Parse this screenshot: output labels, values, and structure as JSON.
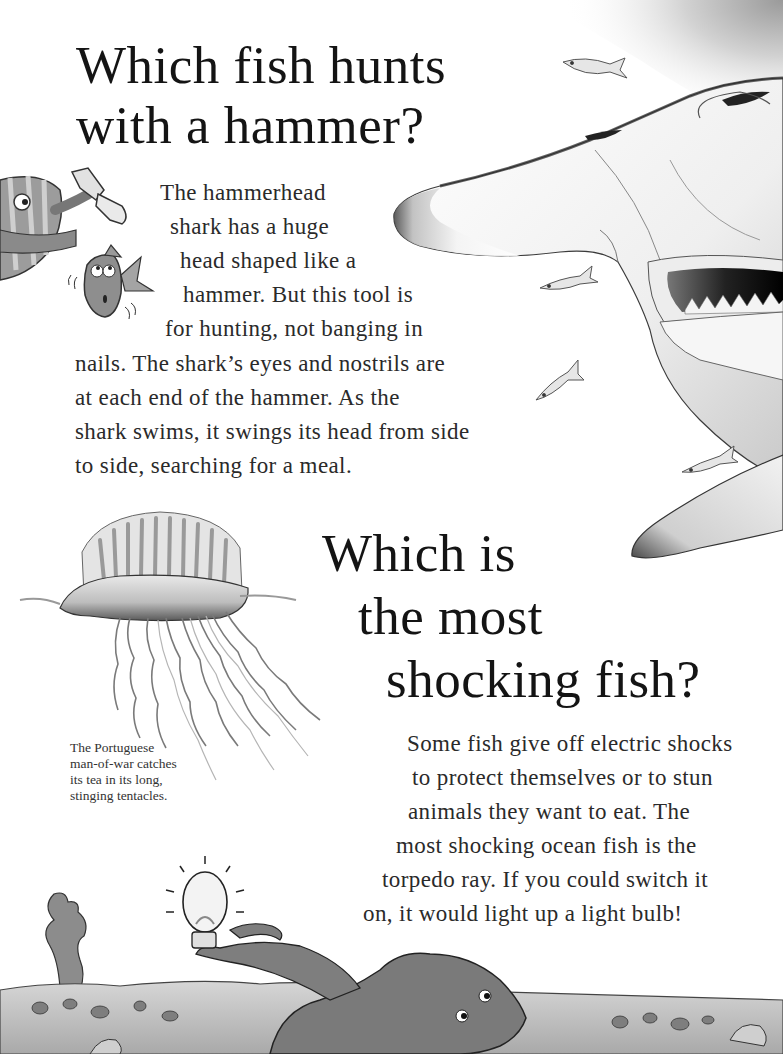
{
  "section_hammerhead": {
    "heading_lines": [
      "Which fish hunts",
      "with a hammer?"
    ],
    "body_lines": [
      "The hammerhead",
      "shark has a huge",
      "head shaped like a",
      "hammer. But this tool is",
      "for hunting, not banging in",
      "nails. The shark’s eyes and nostrils are",
      "at each end of the hammer.  As the",
      "shark swims, it swings its head from side",
      "to side, searching for a meal."
    ]
  },
  "section_shocking": {
    "heading_lines": [
      "Which is",
      "the most",
      "shocking fish?"
    ],
    "body_lines": [
      "Some fish give off electric shocks",
      "to protect themselves or to stun",
      "animals they want to eat. The",
      "most shocking ocean fish is the",
      "torpedo ray. If you could switch it",
      "on, it would light up a light bulb!"
    ]
  },
  "caption_man_of_war": {
    "lines": [
      "The Portuguese",
      "man-of-war catches",
      "its tea in its long,",
      "stinging tentacles."
    ]
  },
  "illustrations": {
    "hammerhead_shark": "hammerhead-shark-illustration",
    "small_fish": "small-fish-illustration",
    "cartoon_fish_with_hammer": "cartoon-fish-hammer-illustration",
    "worried_cartoon_fish": "worried-fish-illustration",
    "portuguese_man_of_war": "man-of-war-illustration",
    "torpedo_ray_with_bulb": "torpedo-ray-lightbulb-illustration",
    "seabed": "seabed-illustration"
  },
  "colors": {
    "background": "#ffffff",
    "text": "#1a1a1a",
    "illustration_dark": "#3a3a3a",
    "illustration_mid": "#8a8a8a",
    "illustration_light": "#d8d8d8"
  }
}
